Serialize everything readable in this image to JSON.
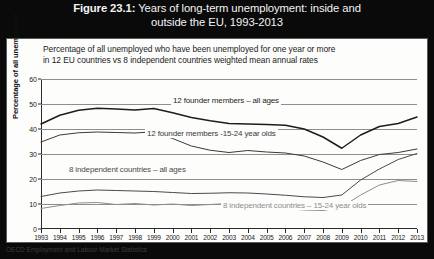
{
  "figure": {
    "number": "Figure 23.1:",
    "title": "Years of long-term unemployment: inside and outside the EU, 1993-2013",
    "title_line1": "Years of long-term unemployment: inside and",
    "title_line2": "outside the EU, 1993-2013",
    "source": "OECD Employment and Labour Market Statistics"
  },
  "chart_data": {
    "type": "line",
    "title": "Years of long-term unemployment: inside and outside the EU, 1993-2013",
    "subtitle": "Percentage of all unemployed who have been unemployed for one year or more in 12 EU countries vs 8 independent countries weighted mean annual rates",
    "subtitle_line1": "Percentage of all unemployed who have been unemployed for one year or more",
    "subtitle_line2": "in 12 EU countries vs 8 independent countries weighted mean annual rates",
    "xlabel": "",
    "ylabel": "Percentage of all unemployed",
    "ylim": [
      0,
      60
    ],
    "yticks": [
      0,
      10,
      20,
      30,
      40,
      50,
      60
    ],
    "grid": true,
    "legend_position": "inline-labels",
    "x": [
      1993,
      1994,
      1995,
      1996,
      1997,
      1998,
      1999,
      2000,
      2001,
      2002,
      2003,
      2004,
      2005,
      2006,
      2007,
      2008,
      2009,
      2010,
      2011,
      2012,
      2013
    ],
    "categories": [
      "1993",
      "1994",
      "1995",
      "1996",
      "1997",
      "1998",
      "1999",
      "2000",
      "2001",
      "2002",
      "2003",
      "2004",
      "2005",
      "2006",
      "2007",
      "2008",
      "2009",
      "2010",
      "2011",
      "2012",
      "2013"
    ],
    "series": [
      {
        "name": "12 founder members – all ages",
        "color": "#1d1d1d",
        "values": [
          42.0,
          45.5,
          47.5,
          48.3,
          48.0,
          47.6,
          48.2,
          46.5,
          44.6,
          43.3,
          42.2,
          42.0,
          41.8,
          41.5,
          40.0,
          36.8,
          32.3,
          37.6,
          41.0,
          42.2,
          44.8
        ]
      },
      {
        "name": "12 founder members -15-24 year olds",
        "color": "#3a3a3a",
        "values": [
          34.8,
          37.6,
          38.5,
          38.8,
          38.6,
          38.4,
          38.9,
          36.2,
          33.2,
          31.5,
          30.6,
          31.4,
          30.8,
          30.4,
          29.2,
          26.8,
          23.8,
          27.4,
          29.8,
          30.6,
          32.0
        ]
      },
      {
        "name": "8 independent countries – all ages",
        "color": "#4a4a4a",
        "values": [
          13.0,
          14.4,
          15.2,
          15.6,
          15.4,
          15.2,
          15.0,
          14.6,
          14.2,
          14.3,
          14.5,
          14.4,
          14.0,
          13.5,
          12.9,
          12.6,
          13.6,
          19.6,
          24.0,
          27.8,
          30.2
        ]
      },
      {
        "name": "8 independent countries – 15-24 year olds",
        "color": "#8d8d8d",
        "values": [
          8.2,
          9.4,
          10.4,
          10.6,
          9.8,
          10.2,
          9.6,
          10.0,
          9.4,
          9.8,
          10.2,
          9.6,
          9.0,
          8.2,
          7.6,
          7.4,
          8.8,
          13.6,
          17.6,
          19.4,
          19.0
        ]
      }
    ],
    "annotations": [
      {
        "text": "12 founder members – all ages",
        "series": 0
      },
      {
        "text": "12 founder members -15-24 year olds",
        "series": 1
      },
      {
        "text": "8 independent countries – all ages",
        "series": 2
      },
      {
        "text": "8 independent countries – 15-24 year olds",
        "series": 3
      }
    ]
  }
}
